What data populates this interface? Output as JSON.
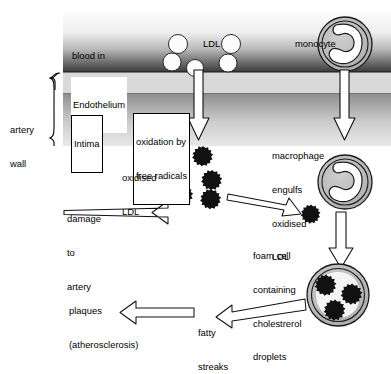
{
  "diagram": {
    "type": "biology-process-diagram",
    "labels": {
      "blood_in_artery": "blood in\nartery",
      "ldl": "LDL",
      "monocyte": "monocyte",
      "endothelium": "Endothelium",
      "intima": "Intima",
      "artery_wall": "artery\nwall",
      "oxidation_by_free_radicals": "oxidation by\nfree radicals",
      "oxidised_ldl": "oxidised\nLDL",
      "macrophage_engulfs": "macrophage\nengulfs\noxidised\nLDL",
      "damage_to_artery": "damage\nto\nartery",
      "foam_cell": "foam cell\ncontaining\ncholestrerol\ndroplets",
      "plaques": "plaques\n(atherosclerosis)",
      "fatty_streaks": "fatty\nstreaks"
    },
    "label_lines": {
      "blood_in_artery_1": "blood in",
      "blood_in_artery_2": "artery",
      "ldl": "LDL",
      "monocyte": "monocyte",
      "endothelium": "Endothelium",
      "intima": "Intima",
      "artery_wall_1": "artery",
      "artery_wall_2": "wall",
      "oxidation_1": "oxidation by",
      "oxidation_2": "free radicals",
      "oxidised_ldl_1": "oxidised",
      "oxidised_ldl_2": "LDL",
      "macrophage_1": "macrophage",
      "macrophage_2": "engulfs",
      "macrophage_3": "oxidised",
      "macrophage_4": "LDL",
      "damage_1": "damage",
      "damage_2": "to",
      "damage_3": "artery",
      "foam_1": "foam cell",
      "foam_2": "containing",
      "foam_3": "cholestrerol",
      "foam_4": "droplets",
      "plaques_1": "plaques",
      "plaques_2": "(atherosclerosis)",
      "fatty_1": "fatty",
      "fatty_2": "streaks"
    },
    "colors": {
      "background": "#ffffff",
      "outline": "#000000",
      "blood_gradient_top": "#f2f2f2",
      "blood_gradient_bottom": "#3a3a3a",
      "endothelium_band": "#d8d8d8",
      "intima_gradient_top": "#8a8a8a",
      "intima_gradient_bottom": "#e3e3e3",
      "ldl_particle": "#ffffff",
      "oxidised_ldl_particle": "#111111",
      "cell_body": "#b8b8b8",
      "arrow_fill": "#ffffff"
    },
    "counts": {
      "ldl_particles": 5,
      "oxidised_ldl_particles": 5,
      "foam_cell_droplets": 3
    }
  }
}
